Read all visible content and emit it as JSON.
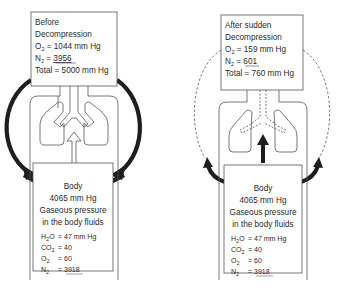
{
  "panels": {
    "before": {
      "lung_box": {
        "line1": "Before",
        "line2": "Decompression",
        "o2_label": "O",
        "o2_sub": "2",
        "o2_value": " = 1044 mm Hg",
        "n2_label": "N",
        "n2_sub": "2",
        "n2_eq": " = ",
        "n2_value": "3956",
        "total": "Total = 5000 mm Hg"
      },
      "body_box": {
        "title": "Body",
        "pressure": "4065 mm Hg",
        "desc1": "Gaseous pressure",
        "desc2": "in the body fluids",
        "h2o_label": "H",
        "h2o_sub": "2",
        "h2o_tail": "O",
        "h2o_value": "=  47 mm Hg",
        "co2_label": "CO",
        "co2_sub": "2",
        "co2_value": "=  40",
        "o2_label": "O",
        "o2_sub": "2",
        "o2_value": "=  60",
        "n2_label": "N",
        "n2_sub": "2",
        "n2_eq": "=  ",
        "n2_value": "3918"
      },
      "flow_arrow": "hollow-up-arrow",
      "circulation": "solid-thick-arrows"
    },
    "after": {
      "lung_box": {
        "line1": "After sudden",
        "line2": "Decompression",
        "o2_label": "O",
        "o2_sub": "2",
        "o2_value": " = 159 mm Hg",
        "n2_label": "N",
        "n2_sub": "2",
        "n2_eq": " = ",
        "n2_value": "601",
        "total": "Total = 760 mm Hg"
      },
      "body_box": {
        "title": "Body",
        "pressure": "4065 mm Hg",
        "desc1": "Gaseous pressure",
        "desc2": "in the body fluids",
        "h2o_label": "H",
        "h2o_sub": "2",
        "h2o_tail": "O",
        "h2o_value": "=  47 mm Hg",
        "co2_label": "CO",
        "co2_sub": "2",
        "co2_value": "=  40",
        "o2_label": "O",
        "o2_sub": "2",
        "o2_value": "=  60",
        "n2_label": "N",
        "n2_sub": "2",
        "n2_eq": "=  ",
        "n2_value": "3918"
      },
      "flow_arrow": "solid-up-arrow",
      "circulation": "dashed-circle-arrows"
    }
  },
  "colors": {
    "ink": "#2a2a2a",
    "line": "#555555",
    "background": "#ffffff"
  }
}
